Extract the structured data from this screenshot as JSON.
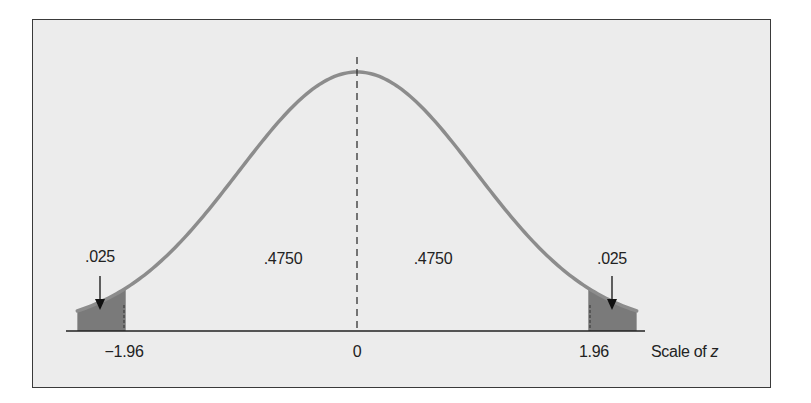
{
  "chart_data": {
    "type": "area",
    "title": "",
    "xlabel": "Scale of z",
    "xlabel_prefix": "Scale of ",
    "xlabel_var": "z",
    "ylabel": "",
    "distribution": "standard normal",
    "x_range": [
      -2.37,
      2.37
    ],
    "tick_labels": [
      "−1.96",
      "0",
      "1.96"
    ],
    "tick_values": [
      -1.96,
      0,
      1.96
    ],
    "regions": [
      {
        "name": "left tail",
        "from": -2.37,
        "to": -1.96,
        "area": ".025",
        "shaded": true
      },
      {
        "name": "left center",
        "from": -1.96,
        "to": 0,
        "area": ".4750",
        "shaded": false
      },
      {
        "name": "right center",
        "from": 0,
        "to": 1.96,
        "area": ".4750",
        "shaded": false
      },
      {
        "name": "right tail",
        "from": 1.96,
        "to": 2.37,
        "area": ".025",
        "shaded": true
      }
    ],
    "annotations": [
      ".025",
      ".4750",
      ".4750",
      ".025"
    ],
    "mean_line": {
      "x": 0,
      "style": "dashed"
    },
    "grid": false,
    "legend": null
  },
  "labels": {
    "left_tail": ".025",
    "left_center": ".4750",
    "right_center": ".4750",
    "right_tail": ".025",
    "tick_neg": "−1.96",
    "tick_zero": "0",
    "tick_pos": "1.96",
    "scale_prefix": "Scale of ",
    "scale_var": "z"
  },
  "colors": {
    "background": "#ececec",
    "curve": "#8c8c8c",
    "shade": "#7a7a7a",
    "axis": "#222222",
    "text": "#222222"
  }
}
